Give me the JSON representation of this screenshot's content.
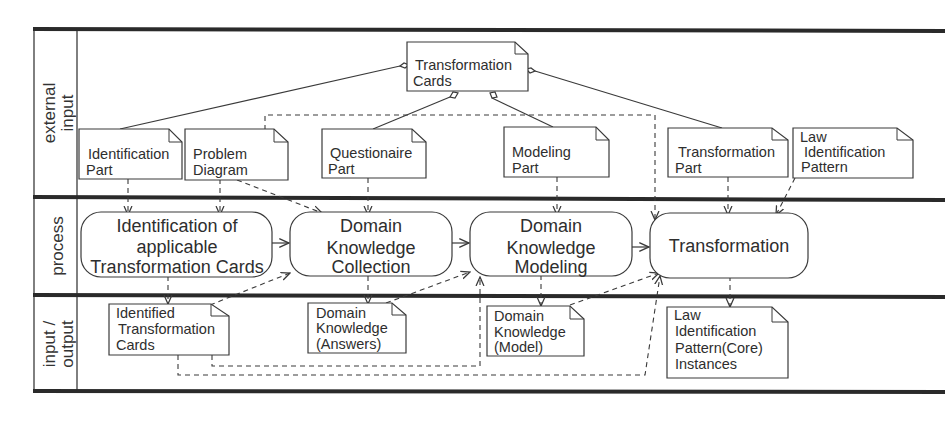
{
  "diagram": {
    "type": "swimlane-activity-diagram",
    "lanes": [
      {
        "id": "external-input",
        "label_lines": [
          "external",
          "input"
        ]
      },
      {
        "id": "process",
        "label_lines": [
          "process"
        ]
      },
      {
        "id": "input-output",
        "label_lines": [
          "input /",
          "output"
        ]
      }
    ],
    "notes": {
      "transformation_cards": [
        "Transformation",
        "Cards"
      ],
      "identification_part": [
        "Identification",
        "Part"
      ],
      "problem_diagram": [
        "Problem",
        "Diagram"
      ],
      "questionaire_part": [
        "Questionaire",
        "Part"
      ],
      "modeling_part": [
        "Modeling",
        "Part"
      ],
      "transformation_part": [
        "Transformation",
        "Part"
      ],
      "law_identification_pattern": [
        "Law",
        "Identification",
        "Pattern"
      ],
      "identified_transformation_cards": [
        "Identified",
        "Transformation",
        "Cards"
      ],
      "domain_knowledge_answers": [
        "Domain",
        "Knowledge",
        "(Answers)"
      ],
      "domain_knowledge_model": [
        "Domain",
        "Knowledge",
        "(Model)"
      ],
      "law_identification_pattern_instances": [
        "Law",
        "Identification",
        "Pattern(Core)",
        "Instances"
      ]
    },
    "processes": {
      "identification": [
        "Identification of",
        "applicable",
        "Transformation Cards"
      ],
      "collection": [
        "Domain",
        "Knowledge",
        "Collection"
      ],
      "modeling": [
        "Domain",
        "Knowledge",
        "Modeling"
      ],
      "transformation": [
        "Transformation"
      ]
    },
    "colors": {
      "line": "#3a3a3a",
      "lane_border": "#2a2a2a",
      "background": "#ffffff"
    }
  }
}
